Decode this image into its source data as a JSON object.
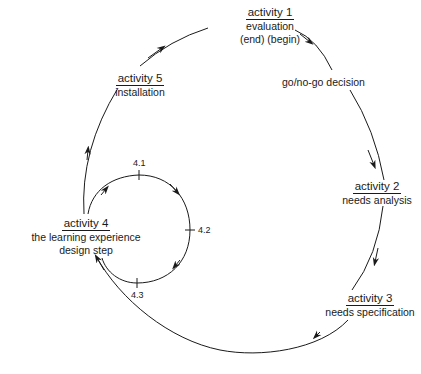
{
  "diagram": {
    "type": "cycle",
    "nodes": [
      {
        "id": "activity-1",
        "title": "activity 1",
        "lines": [
          "evaluation",
          "(end) (begin)"
        ]
      },
      {
        "id": "go-no-go",
        "label": "go/no-go decision"
      },
      {
        "id": "activity-2",
        "title": "activity 2",
        "lines": [
          "needs analysis"
        ]
      },
      {
        "id": "activity-3",
        "title": "activity 3",
        "lines": [
          "needs specification"
        ]
      },
      {
        "id": "activity-4",
        "title": "activity 4",
        "lines": [
          "the learning experience",
          "design step"
        ]
      },
      {
        "id": "activity-5",
        "title": "activity 5",
        "lines": [
          "installation"
        ]
      }
    ],
    "sub_cycle": {
      "parent": "activity-4",
      "ticks": [
        "4.1",
        "4.2",
        "4.3"
      ]
    },
    "edges": [
      {
        "from": "activity-1",
        "to": "go-no-go"
      },
      {
        "from": "go-no-go",
        "to": "activity-2"
      },
      {
        "from": "activity-2",
        "to": "activity-3"
      },
      {
        "from": "activity-3",
        "to": "activity-4"
      },
      {
        "from": "activity-4",
        "to": "activity-5"
      },
      {
        "from": "activity-5",
        "to": "activity-1"
      },
      {
        "from": "activity-4",
        "to": "4.1"
      },
      {
        "from": "4.1",
        "to": "4.2"
      },
      {
        "from": "4.2",
        "to": "4.3"
      },
      {
        "from": "4.3",
        "to": "activity-4"
      }
    ],
    "line_color": "#1a1a1a"
  }
}
